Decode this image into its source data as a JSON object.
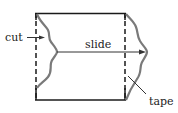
{
  "diagram": {
    "labels": {
      "cut": "cut",
      "slide": "slide",
      "tape": "tape"
    },
    "colors": {
      "outline": "#1a1a1a",
      "curve": "#7a7a7a",
      "text": "#222222",
      "background": "#ffffff"
    }
  }
}
